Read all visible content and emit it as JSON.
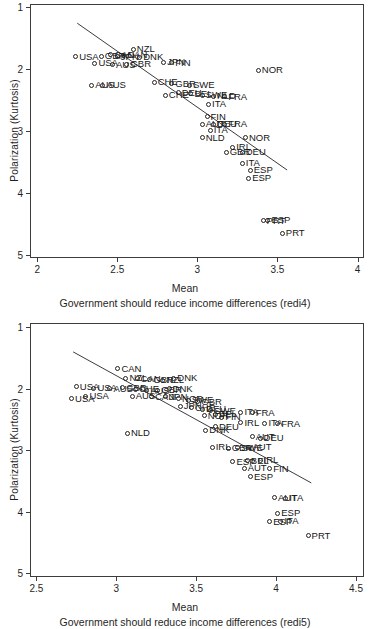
{
  "accent_color": "#000000",
  "background_color": "#ffffff",
  "chart_data": [
    {
      "type": "scatter",
      "ylabel": "Polarization (Kurtosis)",
      "xlabel": "Mean",
      "sublabel": "Government should reduce income differences (redi4)",
      "x_ticks": [
        2,
        2.5,
        3,
        3.5,
        4
      ],
      "y_ticks": [
        1,
        2,
        3,
        4,
        5
      ],
      "x_range": [
        1.955,
        4.04
      ],
      "y_range": [
        0.95,
        5.05
      ],
      "y_axis_direction": "reversed (1 top, 5 bottom)",
      "grid": false,
      "marker": "hollow-circle",
      "trend_line": {
        "x1": 2.25,
        "y1": 1.26,
        "x2": 3.56,
        "y2": 3.63
      },
      "points": [
        {
          "x": 2.24,
          "y": 1.8,
          "label": "USA"
        },
        {
          "x": 2.36,
          "y": 1.91,
          "label": "USA"
        },
        {
          "x": 2.4,
          "y": 1.79,
          "label": "GBR"
        },
        {
          "x": 2.46,
          "y": 1.77,
          "label": "CAN"
        },
        {
          "x": 2.5,
          "y": 1.8,
          "label": "JPN"
        },
        {
          "x": 2.54,
          "y": 1.78,
          "label": "CAN"
        },
        {
          "x": 2.6,
          "y": 1.68,
          "label": "NZL"
        },
        {
          "x": 2.56,
          "y": 1.92,
          "label": "GBR"
        },
        {
          "x": 2.47,
          "y": 1.93,
          "label": "AUS"
        },
        {
          "x": 2.64,
          "y": 1.81,
          "label": "DNK"
        },
        {
          "x": 2.34,
          "y": 2.26,
          "label": "AUS"
        },
        {
          "x": 2.41,
          "y": 2.26,
          "label": "AUS"
        },
        {
          "x": 2.79,
          "y": 1.89,
          "label": "JPN"
        },
        {
          "x": 2.84,
          "y": 1.9,
          "label": "FIN"
        },
        {
          "x": 2.73,
          "y": 2.21,
          "label": "CHE"
        },
        {
          "x": 2.84,
          "y": 2.24,
          "label": "GBR"
        },
        {
          "x": 2.95,
          "y": 2.26,
          "label": "SWE"
        },
        {
          "x": 2.8,
          "y": 2.42,
          "label": "CHE"
        },
        {
          "x": 2.88,
          "y": 2.38,
          "label": "DEU"
        },
        {
          "x": 2.96,
          "y": 2.4,
          "label": "BEL"
        },
        {
          "x": 3.03,
          "y": 2.42,
          "label": "SWE"
        },
        {
          "x": 3.1,
          "y": 2.44,
          "label": "NLD"
        },
        {
          "x": 3.17,
          "y": 2.45,
          "label": "FRA"
        },
        {
          "x": 3.07,
          "y": 2.57,
          "label": "ITA"
        },
        {
          "x": 3.38,
          "y": 2.02,
          "label": "NOR"
        },
        {
          "x": 3.06,
          "y": 2.77,
          "label": "FIN"
        },
        {
          "x": 3.03,
          "y": 2.89,
          "label": "AUT"
        },
        {
          "x": 3.1,
          "y": 2.89,
          "label": "DEU"
        },
        {
          "x": 3.17,
          "y": 2.89,
          "label": "FRA"
        },
        {
          "x": 3.08,
          "y": 2.99,
          "label": "ITA"
        },
        {
          "x": 3.03,
          "y": 3.11,
          "label": "NLD"
        },
        {
          "x": 3.3,
          "y": 3.11,
          "label": "NOR"
        },
        {
          "x": 3.22,
          "y": 3.26,
          "label": "IRL"
        },
        {
          "x": 3.18,
          "y": 3.34,
          "label": "GBR"
        },
        {
          "x": 3.28,
          "y": 3.34,
          "label": "DEU"
        },
        {
          "x": 3.28,
          "y": 3.52,
          "label": "ITA"
        },
        {
          "x": 3.33,
          "y": 3.63,
          "label": "ESP"
        },
        {
          "x": 3.32,
          "y": 3.76,
          "label": "ESP"
        },
        {
          "x": 3.44,
          "y": 4.44,
          "label": "ESP"
        },
        {
          "x": 3.41,
          "y": 4.45,
          "label": "PRT"
        },
        {
          "x": 3.53,
          "y": 4.65,
          "label": "PRT"
        }
      ]
    },
    {
      "type": "scatter",
      "ylabel": "Polarization (Kurtosis)",
      "xlabel": "Mean",
      "sublabel": "Government should reduce income differences (redi5)",
      "x_ticks": [
        2.5,
        3,
        3.5,
        4,
        4.5
      ],
      "y_ticks": [
        1,
        2,
        3,
        4,
        5
      ],
      "x_range": [
        2.46,
        4.55
      ],
      "y_range": [
        0.93,
        5.06
      ],
      "y_axis_direction": "reversed (1 top, 5 bottom)",
      "grid": false,
      "marker": "hollow-circle",
      "trend_line": {
        "x1": 2.73,
        "y1": 1.4,
        "x2": 4.22,
        "y2": 3.53
      },
      "points": [
        {
          "x": 3.01,
          "y": 1.67,
          "label": "CAN"
        },
        {
          "x": 3.06,
          "y": 1.83,
          "label": "NZL"
        },
        {
          "x": 3.13,
          "y": 1.84,
          "label": "CAN"
        },
        {
          "x": 3.21,
          "y": 1.85,
          "label": "GBR"
        },
        {
          "x": 3.29,
          "y": 1.86,
          "label": "NZL"
        },
        {
          "x": 3.36,
          "y": 1.83,
          "label": "DNK"
        },
        {
          "x": 2.75,
          "y": 1.97,
          "label": "USA"
        },
        {
          "x": 2.86,
          "y": 1.99,
          "label": "USA"
        },
        {
          "x": 2.96,
          "y": 2.0,
          "label": "AUS"
        },
        {
          "x": 3.04,
          "y": 1.98,
          "label": "GBR"
        },
        {
          "x": 3.12,
          "y": 2.01,
          "label": "CHE"
        },
        {
          "x": 3.19,
          "y": 2.03,
          "label": "AUS"
        },
        {
          "x": 3.26,
          "y": 2.02,
          "label": "GBR"
        },
        {
          "x": 3.33,
          "y": 2.0,
          "label": "DNK"
        },
        {
          "x": 2.72,
          "y": 2.16,
          "label": "USA"
        },
        {
          "x": 2.81,
          "y": 2.12,
          "label": "USA"
        },
        {
          "x": 3.1,
          "y": 2.12,
          "label": "AUS"
        },
        {
          "x": 3.22,
          "y": 2.13,
          "label": "CAN"
        },
        {
          "x": 3.31,
          "y": 2.13,
          "label": "JPN"
        },
        {
          "x": 3.39,
          "y": 2.16,
          "label": "NOR"
        },
        {
          "x": 3.45,
          "y": 2.19,
          "label": "SWE"
        },
        {
          "x": 3.51,
          "y": 2.21,
          "label": "GBR"
        },
        {
          "x": 3.07,
          "y": 2.72,
          "label": "NLD"
        },
        {
          "x": 3.4,
          "y": 2.28,
          "label": "JPN"
        },
        {
          "x": 3.47,
          "y": 2.31,
          "label": "CHE"
        },
        {
          "x": 3.54,
          "y": 2.33,
          "label": "DEU"
        },
        {
          "x": 3.59,
          "y": 2.36,
          "label": "SWE"
        },
        {
          "x": 3.62,
          "y": 2.41,
          "label": "BEL"
        },
        {
          "x": 3.55,
          "y": 2.44,
          "label": "NOR"
        },
        {
          "x": 3.66,
          "y": 2.46,
          "label": "FIN"
        },
        {
          "x": 3.78,
          "y": 2.38,
          "label": "ITA"
        },
        {
          "x": 3.85,
          "y": 2.39,
          "label": "FRA"
        },
        {
          "x": 3.78,
          "y": 2.55,
          "label": "IRL"
        },
        {
          "x": 3.93,
          "y": 2.56,
          "label": "ITA"
        },
        {
          "x": 4.01,
          "y": 2.57,
          "label": "FRA"
        },
        {
          "x": 3.56,
          "y": 2.67,
          "label": "DNK"
        },
        {
          "x": 3.62,
          "y": 2.62,
          "label": "DEU"
        },
        {
          "x": 3.85,
          "y": 2.78,
          "label": "AUT"
        },
        {
          "x": 3.9,
          "y": 2.8,
          "label": "DEU"
        },
        {
          "x": 3.6,
          "y": 2.95,
          "label": "IRL"
        },
        {
          "x": 3.7,
          "y": 2.97,
          "label": "GBR"
        },
        {
          "x": 3.76,
          "y": 2.96,
          "label": "SWE"
        },
        {
          "x": 3.83,
          "y": 2.95,
          "label": "AUT"
        },
        {
          "x": 3.73,
          "y": 3.19,
          "label": "ESP"
        },
        {
          "x": 3.82,
          "y": 3.17,
          "label": "BEL"
        },
        {
          "x": 3.9,
          "y": 3.16,
          "label": "IRL"
        },
        {
          "x": 3.8,
          "y": 3.29,
          "label": "AUT"
        },
        {
          "x": 3.96,
          "y": 3.3,
          "label": "FIN"
        },
        {
          "x": 3.84,
          "y": 3.43,
          "label": "ESP"
        },
        {
          "x": 3.99,
          "y": 3.77,
          "label": "AUT"
        },
        {
          "x": 4.06,
          "y": 3.78,
          "label": "ITA"
        },
        {
          "x": 4.01,
          "y": 4.02,
          "label": "ESP"
        },
        {
          "x": 3.96,
          "y": 4.16,
          "label": "ESP"
        },
        {
          "x": 4.03,
          "y": 4.15,
          "label": "ITA"
        },
        {
          "x": 4.2,
          "y": 4.39,
          "label": "PRT"
        }
      ]
    }
  ]
}
